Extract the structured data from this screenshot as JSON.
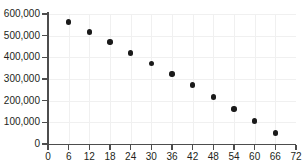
{
  "chart_data": {
    "type": "scatter",
    "title": "",
    "subtitle": "",
    "xlabel": "",
    "ylabel": "",
    "xlim": [
      0,
      72
    ],
    "ylim": [
      0,
      600000
    ],
    "grid": true,
    "legend": null,
    "x_ticks": [
      0,
      6,
      12,
      18,
      24,
      30,
      36,
      42,
      48,
      54,
      60,
      66,
      72
    ],
    "x_tick_labels": [
      "0",
      "6",
      "12",
      "18",
      "24",
      "30",
      "36",
      "42",
      "48",
      "54",
      "60",
      "66",
      "72"
    ],
    "y_ticks": [
      0,
      100000,
      200000,
      300000,
      400000,
      500000,
      600000
    ],
    "y_tick_labels": [
      "0",
      "100,000",
      "200,000",
      "300,000",
      "400,000",
      "500,000",
      "600,000"
    ],
    "series": [
      {
        "name": "series-1",
        "marker": "circle",
        "color": "#1a1a1a",
        "x": [
          6,
          12,
          18,
          24,
          30,
          36,
          42,
          48,
          54,
          60,
          66
        ],
        "y": [
          563000,
          517000,
          470000,
          420000,
          371000,
          323000,
          272000,
          217000,
          162000,
          107000,
          51000
        ]
      }
    ],
    "colors": {
      "background": "#ffffff",
      "gridline": "#f0f0f0",
      "axis": "#4d4d4d",
      "tick_label": "#231f20",
      "marker": "#1a1a1a"
    }
  }
}
